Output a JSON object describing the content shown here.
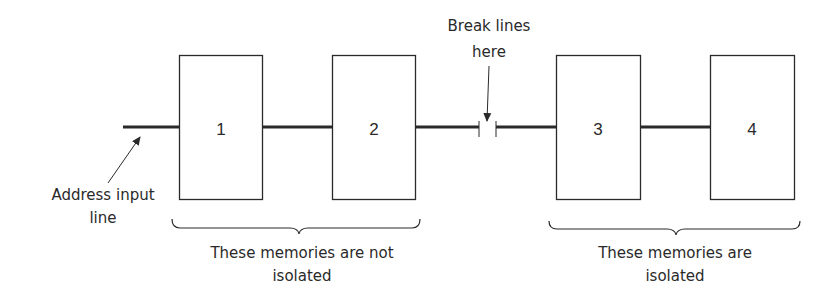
{
  "diagram": {
    "colors": {
      "line": "#2a2a2a",
      "background": "#ffffff"
    },
    "memories": [
      {
        "label": "1"
      },
      {
        "label": "2"
      },
      {
        "label": "3"
      },
      {
        "label": "4"
      }
    ],
    "address_label": {
      "line1": "Address input",
      "line2": "line"
    },
    "break_label": {
      "line1": "Break lines",
      "line2": "here"
    },
    "groups": [
      {
        "line1": "These memories are not",
        "line2": "isolated"
      },
      {
        "line1": "These memories are",
        "line2": "isolated"
      }
    ]
  }
}
